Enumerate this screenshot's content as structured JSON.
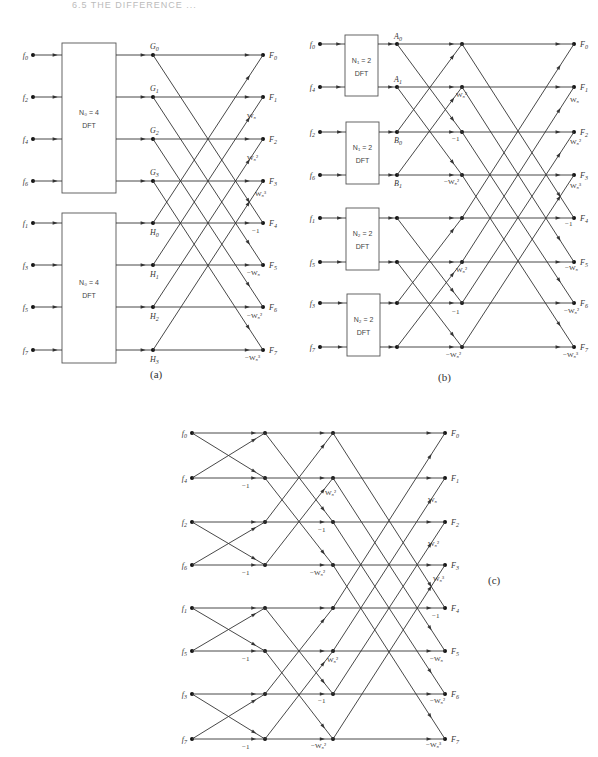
{
  "header": {
    "text": "6.5  THE DIFFERENCE ..."
  },
  "diagrams": [
    {
      "id": "a",
      "caption": "(a)",
      "caption_pos": [
        150,
        378
      ],
      "rows": [
        55,
        97,
        139,
        181,
        223,
        265,
        307,
        350
      ],
      "input_x": 33,
      "inputs": [
        "f0",
        "f2",
        "f4",
        "f6",
        "f1",
        "f3",
        "f5",
        "f7"
      ],
      "boxes": [
        {
          "x": 62,
          "y": 43,
          "w": 54,
          "h": 150,
          "line1": "N₀ = 4",
          "line2": "DFT",
          "rows": [
            0,
            1,
            2,
            3
          ]
        },
        {
          "x": 62,
          "y": 213,
          "w": 54,
          "h": 150,
          "line1": "N₀ = 4",
          "line2": "DFT",
          "rows": [
            4,
            5,
            6,
            7
          ]
        }
      ],
      "stages_x": [
        153,
        263
      ],
      "stage_labels": [
        {
          "stage": 0,
          "labels": [
            "G0",
            "G1",
            "G2",
            "G3",
            "H0",
            "H1",
            "H2",
            "H3"
          ],
          "pos": "above-top-below-bottom"
        }
      ],
      "outputs": [
        "F0",
        "F1",
        "F2",
        "F3",
        "F4",
        "F5",
        "F6",
        "F7"
      ],
      "butterflies": [
        {
          "from_stage": 0,
          "span": 4
        }
      ],
      "weights": [
        {
          "x": 247,
          "y": 118,
          "t": "W₈"
        },
        {
          "x": 247,
          "y": 160,
          "t": "W₈²"
        },
        {
          "x": 255,
          "y": 196,
          "t": "W₈³"
        },
        {
          "x": 252,
          "y": 233,
          "t": "−1"
        },
        {
          "x": 247,
          "y": 275,
          "t": "−W₈"
        },
        {
          "x": 247,
          "y": 318,
          "t": "−W₈²"
        },
        {
          "x": 245,
          "y": 360,
          "t": "−W₈³"
        }
      ]
    },
    {
      "id": "b",
      "caption": "(b)",
      "caption_pos": [
        438,
        381
      ],
      "rows": [
        44,
        87,
        132,
        175,
        218,
        262,
        303,
        347
      ],
      "input_x": 320,
      "inputs": [
        "f0",
        "f4",
        "f2",
        "f6",
        "f1",
        "f5",
        "f3",
        "f7"
      ],
      "boxes": [
        {
          "x": 345,
          "y": 35,
          "w": 33,
          "h": 61,
          "line1": "N₁ = 2",
          "line2": "DFT",
          "rows": [
            0,
            1
          ]
        },
        {
          "x": 346,
          "y": 122,
          "w": 33,
          "h": 62,
          "line1": "N₁ = 2",
          "line2": "DFT",
          "rows": [
            2,
            3
          ]
        },
        {
          "x": 346,
          "y": 208,
          "w": 33,
          "h": 62,
          "line1": "N₂ = 2",
          "line2": "DFT",
          "rows": [
            4,
            5
          ]
        },
        {
          "x": 347,
          "y": 294,
          "w": 33,
          "h": 62,
          "line1": "N₂ = 2",
          "line2": "DFT",
          "rows": [
            6,
            7
          ]
        }
      ],
      "stages_x": [
        397,
        462,
        574
      ],
      "stage_labels": [
        {
          "stage": 0,
          "labels": [
            "A0",
            "A1",
            "B0",
            "B1",
            "",
            "",
            "",
            ""
          ],
          "pos": "b-style"
        }
      ],
      "outputs": [
        "F0",
        "F1",
        "F2",
        "F3",
        "F4",
        "F5",
        "F6",
        "F7"
      ],
      "butterflies": [
        {
          "from_stage": 0,
          "span": 2
        },
        {
          "from_stage": 1,
          "span": 4
        }
      ],
      "weights": [
        {
          "x": 456,
          "y": 97,
          "t": "W₈²"
        },
        {
          "x": 452,
          "y": 141,
          "t": "−1"
        },
        {
          "x": 444,
          "y": 184,
          "t": "−W₈²"
        },
        {
          "x": 456,
          "y": 272,
          "t": "W₈²"
        },
        {
          "x": 452,
          "y": 314,
          "t": "−1"
        },
        {
          "x": 446,
          "y": 357,
          "t": "−W₈²"
        },
        {
          "x": 570,
          "y": 102,
          "t": "W₈"
        },
        {
          "x": 570,
          "y": 144,
          "t": "W₈²"
        },
        {
          "x": 570,
          "y": 188,
          "t": "W₈³"
        },
        {
          "x": 565,
          "y": 226,
          "t": "−1"
        },
        {
          "x": 565,
          "y": 270,
          "t": "−W₈"
        },
        {
          "x": 564,
          "y": 313,
          "t": "−W₈²"
        },
        {
          "x": 563,
          "y": 357,
          "t": "−W₈³"
        }
      ]
    },
    {
      "id": "c",
      "caption": "(c)",
      "caption_pos": [
        488,
        584
      ],
      "rows": [
        433,
        478,
        522,
        565,
        608,
        651,
        694,
        739
      ],
      "input_x": 192,
      "inputs": [
        "f0",
        "f4",
        "f2",
        "f6",
        "f1",
        "f5",
        "f3",
        "f7"
      ],
      "boxes": [],
      "stages_x": [
        192,
        265,
        333,
        445
      ],
      "stage_labels": [],
      "outputs": [
        "F0",
        "F1",
        "F2",
        "F3",
        "F4",
        "F5",
        "F6",
        "F7"
      ],
      "butterflies": [
        {
          "from_stage": 0,
          "span": 1
        },
        {
          "from_stage": 1,
          "span": 2
        },
        {
          "from_stage": 2,
          "span": 4
        }
      ],
      "weights": [
        {
          "x": 242,
          "y": 488,
          "t": "−1"
        },
        {
          "x": 242,
          "y": 575,
          "t": "−1"
        },
        {
          "x": 242,
          "y": 661,
          "t": "−1"
        },
        {
          "x": 242,
          "y": 749,
          "t": "−1"
        },
        {
          "x": 325,
          "y": 495,
          "t": "W₈²"
        },
        {
          "x": 318,
          "y": 532,
          "t": "−1"
        },
        {
          "x": 310,
          "y": 575,
          "t": "−W₈²"
        },
        {
          "x": 327,
          "y": 662,
          "t": "W₈²"
        },
        {
          "x": 318,
          "y": 703,
          "t": "−1"
        },
        {
          "x": 311,
          "y": 748,
          "t": "−W₈²"
        },
        {
          "x": 428,
          "y": 502,
          "t": "W₈"
        },
        {
          "x": 428,
          "y": 546,
          "t": "W₈²"
        },
        {
          "x": 433,
          "y": 581,
          "t": "W₈³"
        },
        {
          "x": 432,
          "y": 618,
          "t": "−1"
        },
        {
          "x": 430,
          "y": 661,
          "t": "−W₈"
        },
        {
          "x": 430,
          "y": 703,
          "t": "−W₈²"
        },
        {
          "x": 426,
          "y": 747,
          "t": "−W₈³"
        }
      ]
    }
  ]
}
